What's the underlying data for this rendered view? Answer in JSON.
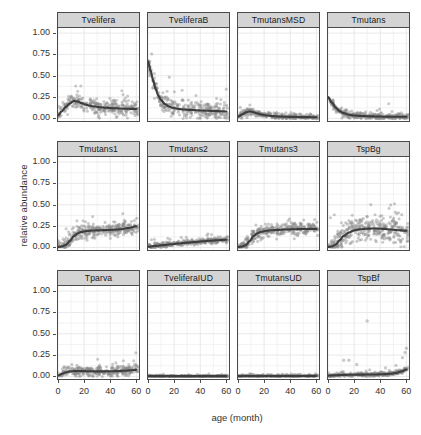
{
  "chart_data": {
    "type": "scatter",
    "title": "",
    "xlabel": "age (month)",
    "ylabel": "relative abundance",
    "xlim": [
      0,
      62
    ],
    "ylim": [
      -0.03,
      1.06
    ],
    "xticks": [
      0,
      20,
      40,
      60
    ],
    "xtick_labels": [
      "0",
      "20",
      "40",
      "60"
    ],
    "yticks": [
      0.0,
      0.25,
      0.5,
      0.75,
      1.0
    ],
    "ytick_labels": [
      "0.00",
      "0.25",
      "0.50",
      "0.75",
      "1.00"
    ],
    "grid": true,
    "legend": "none",
    "facet_layout": {
      "rows": 3,
      "cols": 4
    },
    "point_color": "#8a8a8a",
    "smooth_color": "#3d3d3d",
    "strip_background": "#d4d4d4",
    "panel_border": "#4a4a4a",
    "panels": [
      {
        "label": "Tvelifera",
        "row": 0,
        "col": 0,
        "smooth_x": [
          0,
          3,
          6,
          9,
          12,
          15,
          18,
          21,
          24,
          28,
          32,
          36,
          40,
          44,
          48,
          52,
          56,
          60
        ],
        "smooth_y": [
          0.035,
          0.085,
          0.135,
          0.175,
          0.205,
          0.198,
          0.18,
          0.163,
          0.15,
          0.14,
          0.132,
          0.126,
          0.122,
          0.119,
          0.116,
          0.114,
          0.112,
          0.112
        ],
        "scatter_band": 0.075,
        "scatter_n": 300,
        "max_point": 0.4
      },
      {
        "label": "TveliferaB",
        "row": 0,
        "col": 1,
        "smooth_x": [
          0,
          2,
          4,
          6,
          8,
          10,
          13,
          16,
          20,
          24,
          28,
          32,
          36,
          40,
          46,
          52,
          60
        ],
        "smooth_y": [
          0.67,
          0.56,
          0.44,
          0.34,
          0.265,
          0.215,
          0.168,
          0.14,
          0.12,
          0.11,
          0.104,
          0.1,
          0.097,
          0.094,
          0.09,
          0.086,
          0.082
        ],
        "scatter_band": 0.085,
        "scatter_n": 300,
        "max_point": 1.0
      },
      {
        "label": "TmutansMSD",
        "row": 0,
        "col": 2,
        "smooth_x": [
          0,
          3,
          6,
          9,
          12,
          15,
          18,
          22,
          26,
          30,
          36,
          42,
          48,
          54,
          60
        ],
        "smooth_y": [
          0.02,
          0.045,
          0.072,
          0.082,
          0.072,
          0.058,
          0.045,
          0.035,
          0.028,
          0.024,
          0.02,
          0.018,
          0.016,
          0.015,
          0.014
        ],
        "scatter_band": 0.03,
        "scatter_n": 300,
        "max_point": 0.56
      },
      {
        "label": "Tmutans",
        "row": 0,
        "col": 3,
        "smooth_x": [
          0,
          3,
          6,
          9,
          12,
          16,
          20,
          24,
          28,
          34,
          40,
          46,
          52,
          60
        ],
        "smooth_y": [
          0.25,
          0.185,
          0.125,
          0.085,
          0.062,
          0.044,
          0.035,
          0.03,
          0.027,
          0.024,
          0.022,
          0.021,
          0.02,
          0.02
        ],
        "scatter_band": 0.035,
        "scatter_n": 300,
        "max_point": 0.98
      },
      {
        "label": "Tmutans1",
        "row": 1,
        "col": 0,
        "smooth_x": [
          0,
          3,
          6,
          9,
          12,
          15,
          18,
          22,
          26,
          30,
          36,
          42,
          48,
          54,
          60
        ],
        "smooth_y": [
          0.005,
          0.012,
          0.03,
          0.075,
          0.13,
          0.165,
          0.182,
          0.192,
          0.198,
          0.2,
          0.203,
          0.207,
          0.213,
          0.228,
          0.248
        ],
        "scatter_band": 0.065,
        "scatter_n": 320,
        "max_point": 0.4
      },
      {
        "label": "Tmutans2",
        "row": 1,
        "col": 1,
        "smooth_x": [
          0,
          6,
          12,
          18,
          24,
          30,
          36,
          42,
          48,
          54,
          60
        ],
        "smooth_y": [
          0.008,
          0.018,
          0.028,
          0.038,
          0.047,
          0.056,
          0.064,
          0.072,
          0.079,
          0.085,
          0.09
        ],
        "scatter_band": 0.028,
        "scatter_n": 300,
        "max_point": 0.22
      },
      {
        "label": "Tmutans3",
        "row": 1,
        "col": 2,
        "smooth_x": [
          0,
          3,
          6,
          9,
          12,
          15,
          18,
          22,
          26,
          30,
          36,
          42,
          48,
          54,
          60
        ],
        "smooth_y": [
          0.005,
          0.01,
          0.028,
          0.075,
          0.135,
          0.168,
          0.185,
          0.196,
          0.202,
          0.206,
          0.21,
          0.213,
          0.215,
          0.217,
          0.218
        ],
        "scatter_band": 0.06,
        "scatter_n": 320,
        "max_point": 0.37
      },
      {
        "label": "TspBg",
        "row": 1,
        "col": 3,
        "smooth_x": [
          0,
          3,
          6,
          9,
          12,
          16,
          20,
          25,
          30,
          36,
          42,
          48,
          54,
          60
        ],
        "smooth_y": [
          0.005,
          0.012,
          0.035,
          0.085,
          0.135,
          0.175,
          0.2,
          0.213,
          0.22,
          0.222,
          0.218,
          0.21,
          0.202,
          0.195
        ],
        "scatter_band": 0.125,
        "scatter_n": 340,
        "max_point": 0.52
      },
      {
        "label": "Tparva",
        "row": 2,
        "col": 0,
        "smooth_x": [
          0,
          3,
          6,
          9,
          12,
          16,
          20,
          26,
          32,
          38,
          44,
          50,
          56,
          60
        ],
        "smooth_y": [
          0.01,
          0.03,
          0.048,
          0.058,
          0.062,
          0.063,
          0.062,
          0.06,
          0.059,
          0.06,
          0.062,
          0.066,
          0.072,
          0.078
        ],
        "scatter_band": 0.05,
        "scatter_n": 320,
        "max_point": 0.35
      },
      {
        "label": "TveliferaIUD",
        "row": 2,
        "col": 1,
        "smooth_x": [
          0,
          10,
          20,
          30,
          40,
          50,
          60
        ],
        "smooth_y": [
          0.004,
          0.004,
          0.004,
          0.004,
          0.004,
          0.004,
          0.004
        ],
        "scatter_band": 0.006,
        "scatter_n": 300,
        "max_point": 0.03
      },
      {
        "label": "TmutansUD",
        "row": 2,
        "col": 2,
        "smooth_x": [
          0,
          10,
          20,
          30,
          40,
          50,
          60
        ],
        "smooth_y": [
          0.005,
          0.006,
          0.006,
          0.006,
          0.006,
          0.006,
          0.007
        ],
        "scatter_band": 0.012,
        "scatter_n": 300,
        "max_point": 0.09
      },
      {
        "label": "TspBf",
        "row": 2,
        "col": 3,
        "smooth_x": [
          0,
          6,
          12,
          18,
          24,
          30,
          36,
          42,
          48,
          52,
          56,
          60
        ],
        "smooth_y": [
          0.01,
          0.014,
          0.018,
          0.02,
          0.021,
          0.022,
          0.023,
          0.026,
          0.032,
          0.042,
          0.058,
          0.082
        ],
        "scatter_band": 0.018,
        "scatter_n": 300,
        "max_point": 0.65,
        "outliers": [
          [
            12,
            0.19
          ],
          [
            16,
            0.19
          ],
          [
            22,
            0.14
          ],
          [
            30,
            0.65
          ],
          [
            44,
            0.1
          ],
          [
            52,
            0.13
          ],
          [
            57,
            0.22
          ],
          [
            59,
            0.28
          ],
          [
            60,
            0.33
          ]
        ]
      }
    ]
  }
}
